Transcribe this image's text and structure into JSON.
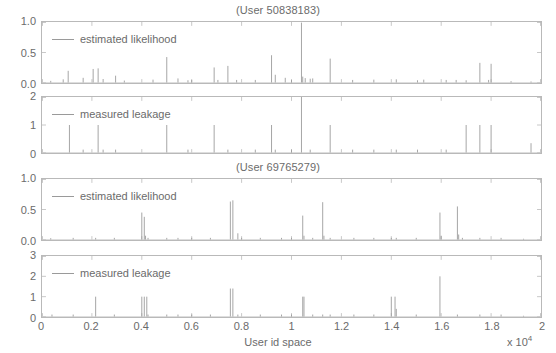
{
  "figure": {
    "width": 556,
    "height": 353,
    "axis_color": "#b9b9b9",
    "line_color": "#9a9a9a",
    "text_color": "#6b6b6b",
    "background": "#ffffff"
  },
  "titles": {
    "user1": "(User 50838183)",
    "user2": "(User 69765279)"
  },
  "xaxis": {
    "label": "User id space",
    "multiplier_prefix": "x 10",
    "multiplier_exponent": "4",
    "ticks": [
      "0",
      "0.2",
      "0.4",
      "0.6",
      "0.8",
      "1",
      "1.2",
      "1.4",
      "1.6",
      "1.8",
      "2"
    ],
    "min": 0,
    "max": 2
  },
  "legends": {
    "estimated": "estimated likelihood",
    "measured": "measured leakage"
  },
  "chart_data": [
    {
      "type": "bar",
      "panel": 1,
      "title": "(User 50838183)",
      "series_name": "estimated likelihood",
      "xlabel": "",
      "ylabel": "",
      "xlim": [
        0,
        2
      ],
      "ylim": [
        0,
        1.0
      ],
      "yticks": [
        "0.0",
        "0.5",
        "1.0"
      ],
      "ytick_values": [
        0.0,
        0.5,
        1.0
      ],
      "grid": false,
      "x": [
        0.035,
        0.085,
        0.105,
        0.165,
        0.205,
        0.225,
        0.245,
        0.295,
        0.33,
        0.445,
        0.5,
        0.545,
        0.585,
        0.6,
        0.69,
        0.705,
        0.745,
        0.78,
        0.855,
        0.92,
        0.935,
        0.975,
        1.0,
        1.04,
        1.045,
        1.055,
        1.075,
        1.085,
        1.155,
        1.245,
        1.33,
        1.42,
        1.505,
        1.53,
        1.62,
        1.66,
        1.7,
        1.755,
        1.79,
        1.8,
        1.88,
        1.96
      ],
      "values": [
        0.035,
        0.06,
        0.2,
        0.085,
        0.23,
        0.24,
        0.065,
        0.12,
        0.04,
        0.055,
        0.425,
        0.075,
        0.045,
        0.05,
        0.255,
        0.05,
        0.28,
        0.05,
        0.05,
        0.455,
        0.135,
        0.085,
        0.05,
        0.99,
        0.105,
        0.08,
        0.07,
        0.075,
        0.4,
        0.05,
        0.055,
        0.06,
        0.045,
        0.055,
        0.05,
        0.05,
        0.045,
        0.33,
        0.05,
        0.315,
        0.03,
        0.025
      ]
    },
    {
      "type": "bar",
      "panel": 2,
      "title": "(User 50838183)",
      "series_name": "measured leakage",
      "xlabel": "",
      "ylabel": "",
      "xlim": [
        0,
        2
      ],
      "ylim": [
        0,
        2
      ],
      "yticks": [
        "0",
        "1",
        "2"
      ],
      "ytick_values": [
        0,
        1,
        2
      ],
      "grid": false,
      "x": [
        0.11,
        0.165,
        0.225,
        0.245,
        0.295,
        0.5,
        0.585,
        0.69,
        0.745,
        0.855,
        0.92,
        0.935,
        1.0,
        1.04,
        1.075,
        1.155,
        1.245,
        1.33,
        1.42,
        1.505,
        1.62,
        1.7,
        1.755,
        1.8,
        1.96
      ],
      "values": [
        1.0,
        0.12,
        1.0,
        0.12,
        0.12,
        1.0,
        0.12,
        1.0,
        0.12,
        0.12,
        1.0,
        0.12,
        0.12,
        2.0,
        0.12,
        1.0,
        0.12,
        0.12,
        0.12,
        0.12,
        0.12,
        1.0,
        1.0,
        1.0,
        0.35
      ]
    },
    {
      "type": "bar",
      "panel": 3,
      "title": "(User 69765279)",
      "series_name": "estimated likelihood",
      "xlabel": "",
      "ylabel": "",
      "xlim": [
        0,
        2
      ],
      "ylim": [
        0,
        1.0
      ],
      "yticks": [
        "0.0",
        "0.5",
        "1.0"
      ],
      "ytick_values": [
        0.0,
        0.5,
        1.0
      ],
      "grid": false,
      "x": [
        0.035,
        0.125,
        0.215,
        0.29,
        0.4,
        0.41,
        0.415,
        0.425,
        0.5,
        0.545,
        0.6,
        0.675,
        0.755,
        0.765,
        0.785,
        0.8,
        0.875,
        0.96,
        1.0,
        1.045,
        1.05,
        1.085,
        1.125,
        1.13,
        1.155,
        1.25,
        1.33,
        1.4,
        1.42,
        1.5,
        1.595,
        1.6,
        1.665,
        1.67,
        1.685,
        1.755,
        1.84,
        1.93
      ],
      "values": [
        0.03,
        0.035,
        0.035,
        0.035,
        0.45,
        0.38,
        0.07,
        0.035,
        0.035,
        0.035,
        0.035,
        0.035,
        0.63,
        0.65,
        0.11,
        0.035,
        0.035,
        0.035,
        0.035,
        0.4,
        0.07,
        0.035,
        0.62,
        0.07,
        0.035,
        0.035,
        0.035,
        0.035,
        0.035,
        0.035,
        0.45,
        0.07,
        0.55,
        0.09,
        0.035,
        0.035,
        0.035,
        0.02
      ]
    },
    {
      "type": "bar",
      "panel": 4,
      "title": "(User 69765279)",
      "series_name": "measured leakage",
      "xlabel": "",
      "ylabel": "",
      "xlim": [
        0,
        2
      ],
      "ylim": [
        0,
        3
      ],
      "yticks": [
        "0",
        "1",
        "2",
        "3"
      ],
      "ytick_values": [
        0,
        1,
        2,
        3
      ],
      "grid": false,
      "x": [
        0.04,
        0.125,
        0.215,
        0.29,
        0.4,
        0.41,
        0.42,
        0.425,
        0.5,
        0.545,
        0.6,
        0.675,
        0.755,
        0.765,
        0.785,
        0.875,
        0.96,
        1.0,
        1.045,
        1.05,
        1.085,
        1.125,
        1.155,
        1.25,
        1.33,
        1.4,
        1.415,
        1.42,
        1.5,
        1.595,
        1.665,
        1.755,
        1.84,
        1.93
      ],
      "values": [
        0.12,
        0.12,
        1.0,
        0.12,
        1.0,
        1.0,
        1.0,
        0.12,
        0.12,
        0.12,
        0.12,
        0.12,
        1.4,
        1.4,
        0.12,
        0.12,
        0.12,
        0.12,
        1.0,
        1.0,
        0.12,
        0.12,
        0.12,
        0.12,
        0.12,
        1.0,
        1.0,
        0.4,
        0.12,
        2.0,
        0.12,
        0.12,
        0.12,
        0.06
      ]
    }
  ]
}
